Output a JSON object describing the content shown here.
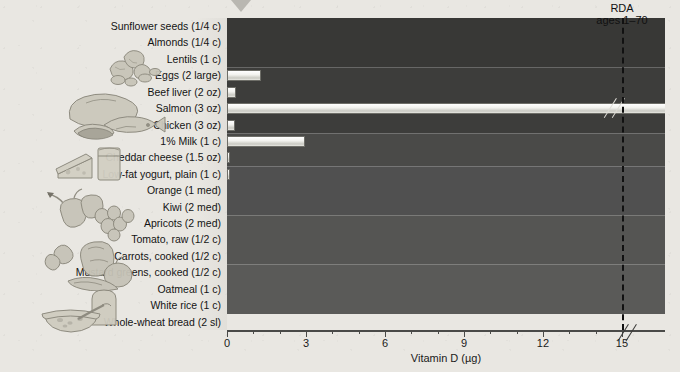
{
  "chart_data": {
    "type": "bar",
    "orientation": "horizontal",
    "title": "",
    "xlabel": "Vitamin D (µg)",
    "ylabel": "",
    "xlim": [
      0,
      16.6
    ],
    "xticks": [
      0,
      3,
      6,
      9,
      12,
      15
    ],
    "xtick_labels": [
      "0",
      "3",
      "6",
      "9",
      "12",
      "15"
    ],
    "minor_tick_step": 1,
    "axis_break_after": 15,
    "grid": false,
    "legend": null,
    "categories": [
      "Sunflower seeds (1/4 c)",
      "Almonds (1/4 c)",
      "Lentils (1 c)",
      "Eggs (2 large)",
      "Beef liver (2 oz)",
      "Salmon (3 oz)",
      "Chicken (3 oz)",
      "1% Milk (1 c)",
      "Cheddar cheese (1.5 oz)",
      "Low-fat yogurt, plain (1 c)",
      "Orange (1 med)",
      "Kiwi (2 med)",
      "Apricots (2 med)",
      "Tomato, raw (1/2 c)",
      "Carrots, cooked (1/2 c)",
      "Mustard greens, cooked (1/2 c)",
      "Oatmeal (1 c)",
      "White rice (1 c)",
      "Whole-wheat bread (2 sl)"
    ],
    "values": [
      0,
      0,
      0,
      1.3,
      0.35,
      16.2,
      0.3,
      2.95,
      0.1,
      0.05,
      0,
      0,
      0,
      0,
      0,
      0,
      0,
      0,
      0
    ],
    "value_exceeds_axis": [
      false,
      false,
      false,
      false,
      false,
      true,
      false,
      false,
      false,
      false,
      false,
      false,
      false,
      false,
      false,
      false,
      false,
      false,
      false
    ],
    "annotations": [
      {
        "name": "rda-marker",
        "line1": "RDA",
        "line2": "ages 1–70",
        "value": 15
      }
    ]
  },
  "rda": {
    "line1": "RDA",
    "line2": "ages 1–70"
  },
  "axis": {
    "title": "Vitamin D (µg)",
    "ticks": [
      "0",
      "3",
      "6",
      "9",
      "12",
      "15"
    ]
  },
  "food_groups": [
    {
      "name": "nuts-seeds-legumes",
      "label": "Nuts, seeds and legumes",
      "shade": "#383836",
      "rows": 3,
      "icon": "nuts-icon"
    },
    {
      "name": "meats-protein",
      "label": "Meats and protein foods",
      "shade": "#3d3d3b",
      "rows": 4,
      "icon": "meat-fish-icon"
    },
    {
      "name": "dairy",
      "label": "Milk and milk products",
      "shade": "#4a4a48",
      "rows": 2,
      "icon": "cheese-milk-icon"
    },
    {
      "name": "fruits",
      "label": "Fruits",
      "shade": "#505050",
      "rows": 3,
      "icon": "fruit-icon"
    },
    {
      "name": "vegetables",
      "label": "Vegetables",
      "shade": "#555553",
      "rows": 3,
      "icon": "vegetables-icon"
    },
    {
      "name": "grains",
      "label": "Grains",
      "shade": "#5a5a58",
      "rows": 3,
      "icon": "bread-oatmeal-icon"
    }
  ],
  "rows": [
    {
      "label": "Sunflower seeds (1/4 c)",
      "value": 0,
      "group": 0
    },
    {
      "label": "Almonds (1/4 c)",
      "value": 0,
      "group": 0
    },
    {
      "label": "Lentils (1 c)",
      "value": 0,
      "group": 0
    },
    {
      "label": "Eggs (2 large)",
      "value": 1.3,
      "group": 1
    },
    {
      "label": "Beef liver (2 oz)",
      "value": 0.35,
      "group": 1
    },
    {
      "label": "Salmon (3 oz)",
      "value": 16.2,
      "group": 1
    },
    {
      "label": "Chicken (3 oz)",
      "value": 0.3,
      "group": 1
    },
    {
      "label": "1% Milk (1 c)",
      "value": 2.95,
      "group": 2
    },
    {
      "label": "Cheddar cheese (1.5 oz)",
      "value": 0.1,
      "group": 2
    },
    {
      "label": "Low-fat yogurt, plain (1 c)",
      "value": 0.05,
      "group": 2
    },
    {
      "label": "Orange (1 med)",
      "value": 0,
      "group": 3
    },
    {
      "label": "Kiwi (2 med)",
      "value": 0,
      "group": 3
    },
    {
      "label": "Apricots (2 med)",
      "value": 0,
      "group": 3
    },
    {
      "label": "Tomato, raw (1/2 c)",
      "value": 0,
      "group": 4
    },
    {
      "label": "Carrots, cooked (1/2 c)",
      "value": 0,
      "group": 4
    },
    {
      "label": "Mustard greens, cooked (1/2 c)",
      "value": 0,
      "group": 4
    },
    {
      "label": "Oatmeal (1 c)",
      "value": 0,
      "group": 5
    },
    {
      "label": "White rice (1 c)",
      "value": 0,
      "group": 5
    },
    {
      "label": "Whole-wheat bread (2 sl)",
      "value": 0,
      "group": 5
    }
  ],
  "colors": {
    "paper": "#e9e7e2",
    "bar_fill": "#f2f2ee",
    "bar_stroke": "#6e6e68",
    "axis": "#4a4a48",
    "rda_line": "#111111",
    "text": "#141414"
  }
}
